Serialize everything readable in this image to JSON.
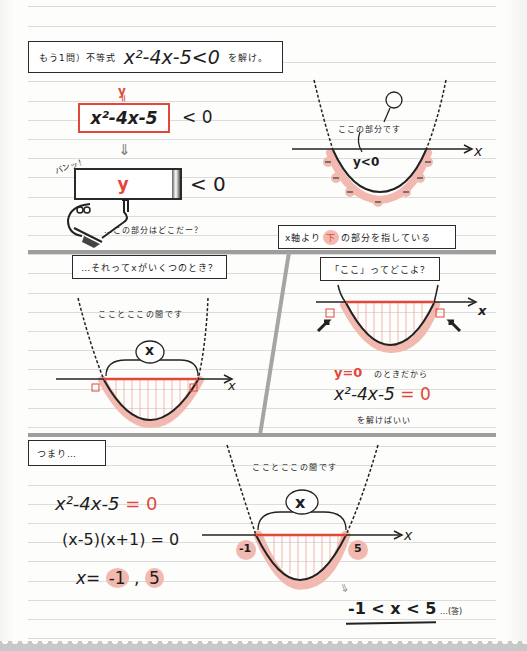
{
  "header": {
    "prefix": "もう1問）不等式",
    "expression": "x²-4x-5<0",
    "suffix": "を解け。"
  },
  "panel1": {
    "y_label": "y",
    "equals_mark": "=",
    "expression": "x²-4x-5",
    "less_than_zero": "< 0",
    "down_arrow": "⇓",
    "sign_y": "y",
    "sign_lt_zero": "< 0",
    "sfx": "バンッ！",
    "question": "…この部分はどこだー？"
  },
  "panel2": {
    "speech": "ここの部分です",
    "region_label": "y<0",
    "axis_label": "x",
    "minus_sign": "−",
    "caption_prefix": "x軸より",
    "caption_highlight": "下",
    "caption_suffix": "の部分を指している"
  },
  "panel3": {
    "caption": "…それってxがいくつのとき？",
    "note": "こことここの間です",
    "bubble": "x",
    "axis_label": "x"
  },
  "panel4": {
    "caption": "「ここ」ってどこよ？",
    "axis_label": "x",
    "condition_red": "y=0",
    "condition_text": "のときだから",
    "equation_black": "x²-4x-5",
    "equation_red": "= 0",
    "instruction": "を解けばいい"
  },
  "panel5": {
    "caption": "つまり…",
    "line1_black": "x²-4x-5",
    "line1_red": "= 0",
    "line2": "(x-5)(x+1) = 0",
    "line3_prefix": "x=",
    "root1": "-1",
    "comma": ",",
    "root2": "5",
    "note": "こことここの間です",
    "bubble": "x",
    "axis_label": "x",
    "label_left": "-1",
    "label_right": "5",
    "therefore": "⇓",
    "answer": "-1 < x < 5",
    "answer_suffix": "…(答)"
  },
  "colors": {
    "accent_red": "#e2473a",
    "highlight_pink": "#f2b9b0",
    "ink": "#1d1d1d",
    "separator_gray": "#9e9e9e",
    "rule_gray": "#dcdcdc"
  }
}
